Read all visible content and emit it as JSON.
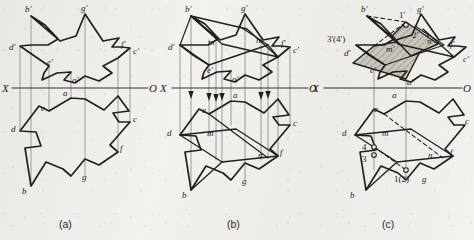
{
  "figure": {
    "background_color": "#f2f1ee",
    "ink_color": "#231f1d",
    "hatch_color": "#9b9790",
    "panels": [
      {
        "id": "a",
        "caption": "(a)",
        "axis": {
          "left_label": "X",
          "right_label": "O"
        },
        "vertex_labels": [
          "b'",
          "g'",
          "d'",
          "f'",
          "c'",
          "e'",
          "a'",
          "a",
          "e",
          "c",
          "d",
          "f",
          "g",
          "b"
        ]
      },
      {
        "id": "b",
        "caption": "(b)",
        "axis": {
          "left_label": "X",
          "right_label": "O"
        },
        "vertex_labels": [
          "b'",
          "g'",
          "m'",
          "n'",
          "d'",
          "f'",
          "c'",
          "e'",
          "a'",
          "a",
          "e",
          "m",
          "n",
          "d",
          "c",
          "f",
          "g",
          "b"
        ]
      },
      {
        "id": "c",
        "caption": "(c)",
        "axis": {
          "left_label": "X",
          "right_label": "O"
        },
        "vertex_labels": [
          "b'",
          "1'",
          "g'",
          "2'",
          "3'(4')",
          "m'",
          "n'",
          "f'",
          "d'",
          "c'",
          "e'",
          "a'",
          "a",
          "e",
          "m",
          "d",
          "c",
          "4",
          "3",
          "n",
          "f",
          "1(2)",
          "g",
          "b"
        ]
      }
    ],
    "captions": {
      "a": "(a)",
      "b": "(b)",
      "c": "(c)"
    },
    "axis_left": "X",
    "axis_right": "O",
    "labels": {
      "b_p": "b'",
      "g_p": "g'",
      "d_p": "d'",
      "f_p": "f'",
      "c_p": "c'",
      "e_p": "e'",
      "a_p": "a'",
      "m_p": "m'",
      "n_p": "n'",
      "a": "a",
      "b": "b",
      "c": "c",
      "d": "d",
      "e": "e",
      "f": "f",
      "g": "g",
      "m": "m",
      "n": "n",
      "p1_p": "1'",
      "p2_p": "2'",
      "p34_p": "3'(4')",
      "p12": "1(2)",
      "p3": "3",
      "p4": "4"
    }
  }
}
